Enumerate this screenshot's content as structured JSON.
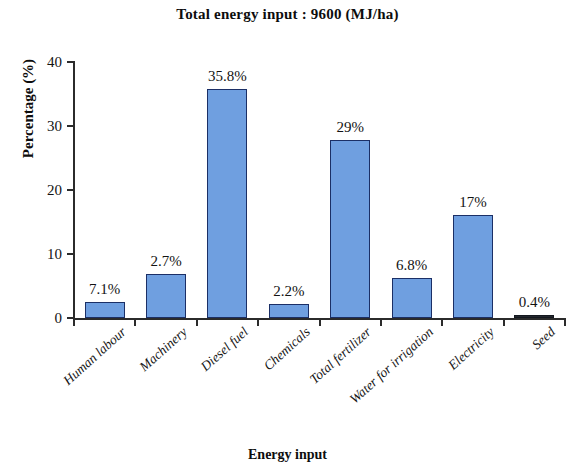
{
  "chart_data": {
    "type": "bar",
    "title": "Total energy input : 9600 (MJ/ha)",
    "xlabel": "Energy input",
    "ylabel": "Percentage (%)",
    "ylim": [
      0,
      40
    ],
    "yticks": [
      0,
      10,
      20,
      30,
      40
    ],
    "grid": false,
    "legend": false,
    "categories": [
      "Human labour",
      "Machinery",
      "Diesel fuel",
      "Chemicals",
      "Total fertilizer",
      "Water for irrigation",
      "Electricity",
      "Seed"
    ],
    "values": [
      2.5,
      6.9,
      35.8,
      2.2,
      27.8,
      6.3,
      16.1,
      0.4
    ],
    "data_labels": [
      "7.1%",
      "2.7%",
      "35.8%",
      "2.2%",
      "29%",
      "6.8%",
      "17%",
      "0.4%"
    ],
    "bar_fill_color": "#6f9fe0",
    "bar_edge_color": "#1b2f66"
  }
}
